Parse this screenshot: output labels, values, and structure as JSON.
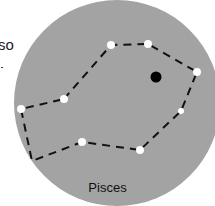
{
  "fragment_text": "so",
  "constellation": {
    "name": "Pisces",
    "background_color": "#a3a3a3",
    "star_color": "#ffffff",
    "line_color": "#111111",
    "stars": [
      {
        "x": 111,
        "y": 45
      },
      {
        "x": 148,
        "y": 44
      },
      {
        "x": 197,
        "y": 72
      },
      {
        "x": 181,
        "y": 111
      },
      {
        "x": 140,
        "y": 150
      },
      {
        "x": 82,
        "y": 142
      },
      {
        "x": 32,
        "y": 161
      },
      {
        "x": 21,
        "y": 109
      },
      {
        "x": 64,
        "y": 99
      }
    ],
    "planet": {
      "x": 156,
      "y": 77,
      "color": "#000000"
    }
  }
}
